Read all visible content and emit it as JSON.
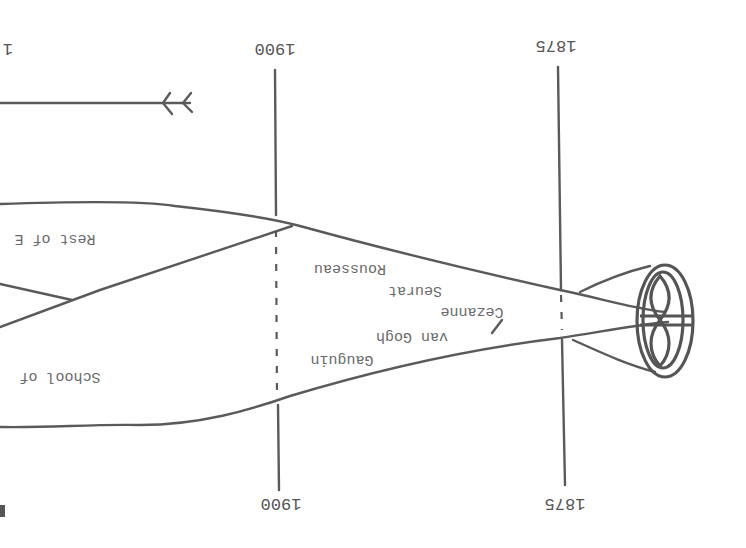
{
  "diagram": {
    "orientation": "rotated-180",
    "years_top": {
      "left": "1",
      "mid": "1900",
      "right": "1875"
    },
    "years_bottom": {
      "mid": "1900",
      "right": "1875"
    },
    "labels": {
      "rest": "Rest of E",
      "school": "School of",
      "rousseau": "Rousseau",
      "seurat": "Seurat",
      "cezanne": "Cezanne",
      "vangogh": "van Gogh",
      "gauguin": "Gauguin"
    },
    "colors": {
      "ink": "#5a5a5a",
      "paper": "#ffffff"
    }
  }
}
